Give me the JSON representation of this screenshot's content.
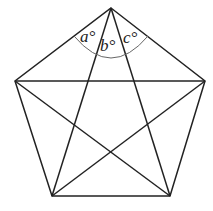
{
  "diagram": {
    "type": "regular pentagon with all diagonals",
    "vertices": {
      "top": [
        111,
        8
      ],
      "right": [
        205,
        81
      ],
      "bottom_right": [
        170,
        196
      ],
      "bottom_left": [
        52,
        196
      ],
      "left": [
        15,
        81
      ]
    },
    "angle_labels": [
      {
        "name": "a",
        "text": "a°",
        "x": 80,
        "y": 42
      },
      {
        "name": "b",
        "text": "b°",
        "x": 100,
        "y": 51
      },
      {
        "name": "c",
        "text": "c°",
        "x": 123,
        "y": 43
      }
    ],
    "line_color": "#222222",
    "arc_color": "#666666"
  }
}
